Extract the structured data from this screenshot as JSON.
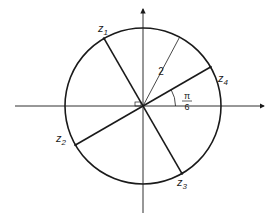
{
  "diagram": {
    "radius_label": "2",
    "angle_label": {
      "numerator": "π",
      "denominator": "6"
    },
    "radius_value": 2,
    "angle_of_z4_radians": "π/6",
    "points": [
      {
        "name": "z1",
        "base": "z",
        "sub": "1",
        "angle_deg": 120
      },
      {
        "name": "z2",
        "base": "z",
        "sub": "2",
        "angle_deg": 210
      },
      {
        "name": "z3",
        "base": "z",
        "sub": "3",
        "angle_deg": 300
      },
      {
        "name": "z4",
        "base": "z",
        "sub": "4",
        "angle_deg": 30
      }
    ],
    "radius_line_angle_deg": 62,
    "colors": {
      "ink": "#1a1a1a",
      "background": "#ffffff"
    }
  }
}
